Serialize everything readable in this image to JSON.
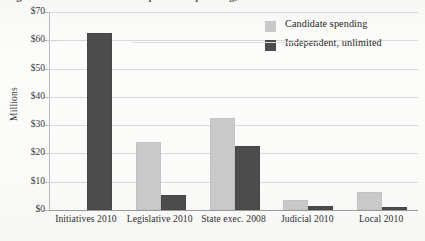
{
  "caption": {
    "text": "Figure 3. Candidate and independent spending, selected races"
  },
  "chart_data": {
    "type": "bar",
    "title": "",
    "xlabel": "",
    "ylabel": "Millions",
    "ylim": [
      0,
      70
    ],
    "ytick_values": [
      0,
      10,
      20,
      30,
      40,
      50,
      60,
      70
    ],
    "ytick_labels": [
      "$0",
      "$10",
      "$20",
      "$30",
      "$40",
      "$50",
      "$60",
      "$70"
    ],
    "grid": true,
    "legend_position": "top-right inside plot",
    "categories": [
      "Initiatives 2010",
      "Legislative 2010",
      "State exec. 2008",
      "Judicial 2010",
      "Local 2010"
    ],
    "series": [
      {
        "name": "Candidate spending",
        "color": "#c9c9c9",
        "values": [
          0,
          23.5,
          32.0,
          3.0,
          5.5
        ]
      },
      {
        "name": "Independent, unlimited",
        "color": "#4c4c4c",
        "values": [
          62.0,
          4.5,
          22.0,
          0.6,
          0.4
        ]
      }
    ]
  },
  "colors": {
    "candidate": "#c9c9c9",
    "independent": "#4c4c4c",
    "grid": "#d9d9d9",
    "axis": "#9a9a9a",
    "page": "#fbfbfa"
  }
}
